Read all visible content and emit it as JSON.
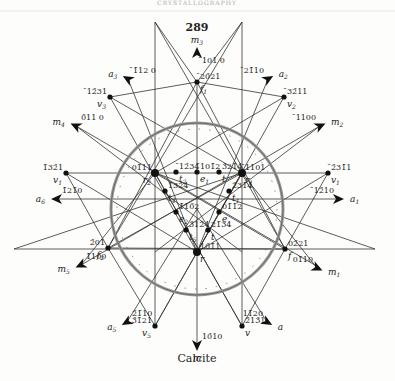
{
  "header": {
    "running_head": "CRYSTALLOGRAPHY",
    "page_number": "289"
  },
  "caption": "Calcite",
  "circle": {
    "cx": 197,
    "cy": 209,
    "r": 86
  },
  "poles": [
    {
      "id": "r",
      "index": "10̄1̄1",
      "symbol": "r",
      "sub": "",
      "x": 197,
      "y": 252
    },
    {
      "id": "r1",
      "index": "̄1101",
      "symbol": "r",
      "sub": "1",
      "x": 242,
      "y": 173
    },
    {
      "id": "r2",
      "index": "01̄11",
      "symbol": "r",
      "sub": "2",
      "x": 155,
      "y": 173
    },
    {
      "id": "f1",
      "index": "̄20̄21",
      "symbol": "f",
      "sub": "1",
      "x": 197,
      "y": 82
    },
    {
      "id": "f",
      "index": "02̄21",
      "symbol": "f",
      "sub": "",
      "x": 285,
      "y": 249
    },
    {
      "id": "f2",
      "index": "2̄01",
      "symbol": "f",
      "sub": "2",
      "x": 108,
      "y": 248
    },
    {
      "id": "e1",
      "index": "̄101̄2",
      "symbol": "e",
      "sub": "1",
      "x": 197,
      "y": 172
    },
    {
      "id": "e",
      "index": "01̄1̄2",
      "symbol": "e",
      "sub": "",
      "x": 219,
      "y": 212
    },
    {
      "id": "e2",
      "index": "1̄10̄2",
      "symbol": "e",
      "sub": "2",
      "x": 176,
      "y": 212
    },
    {
      "id": "t2",
      "index": "̄12̄34",
      "symbol": "t",
      "sub": "2",
      "x": 176,
      "y": 172
    },
    {
      "id": "t",
      "index": "3̄21̄4",
      "symbol": "t",
      "sub": "",
      "x": 219,
      "y": 172
    },
    {
      "id": "t4",
      "index": "1̄32̄4",
      "symbol": "t",
      "sub": "4",
      "x": 165,
      "y": 191
    },
    {
      "id": "t1",
      "index": "2̄31̄4",
      "symbol": "t",
      "sub": "1",
      "x": 229,
      "y": 191
    },
    {
      "id": "t5",
      "index": "3̄12̄4",
      "symbol": "t",
      "sub": "5",
      "x": 186,
      "y": 230
    },
    {
      "id": "t6",
      "index": "21̄34",
      "symbol": "t",
      "sub": "",
      "x": 208,
      "y": 230
    },
    {
      "id": "v1",
      "index": "̄2̄31̄1",
      "symbol": "v",
      "sub": "1",
      "x": 328,
      "y": 173
    },
    {
      "id": "v1b",
      "index": "1̄32̄1",
      "symbol": "v",
      "sub": "1",
      "x": 66,
      "y": 173
    },
    {
      "id": "v2",
      "index": "̄32̄11",
      "symbol": "v",
      "sub": "2",
      "x": 284,
      "y": 97
    },
    {
      "id": "v3",
      "index": "̄12̄31",
      "symbol": "v",
      "sub": "3",
      "x": 110,
      "y": 97
    },
    {
      "id": "v5",
      "index": "3̄1̄21",
      "symbol": "v",
      "sub": "5",
      "x": 155,
      "y": 326
    },
    {
      "id": "v",
      "index": "2̄13̄1",
      "symbol": "v",
      "sub": "",
      "x": 242,
      "y": 326
    }
  ],
  "arrows": [
    {
      "id": "m3",
      "index": "̄101 0",
      "label": "m",
      "sub": "3",
      "x": 197,
      "y": 53,
      "angle": -90
    },
    {
      "id": "a3",
      "index": "̄1̄12 0",
      "label": "a",
      "sub": "3",
      "x": 128,
      "y": 79,
      "angle": -150
    },
    {
      "id": "a2",
      "index": "̄21̄10",
      "label": "a",
      "sub": "2",
      "x": 268,
      "y": 79,
      "angle": -30
    },
    {
      "id": "m4",
      "index": "0̄11 0",
      "label": "m",
      "sub": "4",
      "x": 76,
      "y": 126,
      "angle": -155
    },
    {
      "id": "m2",
      "index": "̄1100",
      "label": "m",
      "sub": "2",
      "x": 320,
      "y": 126,
      "angle": -25
    },
    {
      "id": "a6",
      "index": "1̄21̄0",
      "label": "a",
      "sub": "6",
      "x": 57,
      "y": 199,
      "angle": 180
    },
    {
      "id": "a1",
      "index": "̄12̄10",
      "label": "a",
      "sub": "1",
      "x": 338,
      "y": 199,
      "angle": 0
    },
    {
      "id": "m5",
      "index": "1̄100",
      "label": "m",
      "sub": "5",
      "x": 81,
      "y": 265,
      "angle": 155
    },
    {
      "id": "m1",
      "index": "01̄10",
      "label": "m",
      "sub": "1",
      "x": 317,
      "y": 268,
      "angle": 25
    },
    {
      "id": "a5",
      "index": "2̄1̄10",
      "label": "a",
      "sub": "5",
      "x": 127,
      "y": 322,
      "angle": 150
    },
    {
      "id": "a",
      "index": "11̄20",
      "label": "a",
      "sub": "",
      "x": 267,
      "y": 322,
      "angle": 30
    },
    {
      "id": "m",
      "index": "10̄10",
      "label": "m",
      "sub": "",
      "x": 197,
      "y": 345,
      "angle": 90
    }
  ]
}
